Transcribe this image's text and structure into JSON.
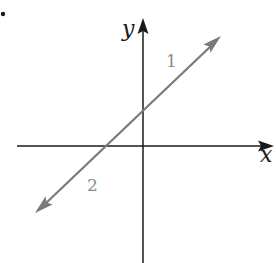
{
  "diagram": {
    "type": "coordinate-plane",
    "axes": {
      "x_label": "x",
      "y_label": "y",
      "origin_px": [
        143,
        146
      ],
      "x_axis_px": {
        "start": [
          17,
          146
        ],
        "end": [
          272,
          146
        ]
      },
      "y_axis_px": {
        "start": [
          143,
          263
        ],
        "end": [
          143,
          18
        ]
      }
    },
    "line": {
      "description": "Straight line with arrowheads at both ends, positive slope, positive y-intercept, negative x-intercept",
      "color": "#7a7a7a",
      "end_upper_right_px": [
        220,
        37
      ],
      "end_lower_left_px": [
        36,
        212
      ],
      "y_intercept_px": [
        143,
        110
      ],
      "x_intercept_px": [
        104,
        146
      ]
    },
    "region_labels": [
      {
        "text": "1",
        "position_px": [
          172,
          66
        ],
        "side": "above line (upper region)"
      },
      {
        "text": "2",
        "position_px": [
          93,
          190
        ],
        "side": "below line (lower region)"
      }
    ],
    "axis_colors": {
      "axes": "#1a1a1a",
      "line": "#7a7a7a",
      "labels": "#8a8a8a"
    },
    "marker": {
      "type": "dot",
      "position_px": [
        3,
        14
      ]
    }
  }
}
